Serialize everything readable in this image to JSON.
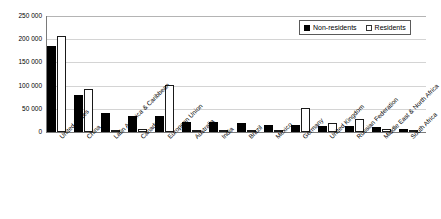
{
  "chart_data": {
    "type": "bar",
    "title": "",
    "subtitle": "",
    "xlabel": "",
    "ylabel": "",
    "ylim": [
      0,
      250000
    ],
    "ytick_step": 50000,
    "ytick_labels": [
      "0",
      "50 000",
      "100 000",
      "150 000",
      "200 000",
      "250 000"
    ],
    "ytick_values": [
      0,
      50000,
      100000,
      150000,
      200000,
      250000
    ],
    "grid": true,
    "grid_axis": "y",
    "legend_position": "top-right",
    "thousands_separator": " ",
    "categories": [
      "United States",
      "China",
      "Latin America & Caribbean",
      "Canada",
      "European Union",
      "Australia",
      "India",
      "Brazil",
      "Mexico",
      "Germany",
      "United Kingdom",
      "Russian Federation",
      "Middle East & North Africa",
      "South Africa"
    ],
    "series": [
      {
        "name": "Non-residents",
        "color": "#000000",
        "fill": "solid",
        "values": [
          185000,
          80000,
          41000,
          35000,
          35000,
          22000,
          21000,
          19000,
          16000,
          15000,
          13000,
          12000,
          11000,
          6000
        ]
      },
      {
        "name": "Residents",
        "color": "#ffffff",
        "fill": "hollow",
        "values": [
          208000,
          93000,
          5000,
          5500,
          102000,
          3000,
          4500,
          3500,
          1500,
          52000,
          20000,
          28000,
          5500,
          1500
        ]
      }
    ]
  },
  "legend": {
    "items": [
      {
        "label": "Non-residents",
        "swatch": "filled-square"
      },
      {
        "label": "Residents",
        "swatch": "hollow-square"
      }
    ]
  },
  "colors": {
    "nonresidents": "#000000",
    "residents": "#ffffff",
    "gridline": "#d4d4d4",
    "axis": "#7a7a7a",
    "text": "#000000",
    "background": "#ffffff"
  }
}
